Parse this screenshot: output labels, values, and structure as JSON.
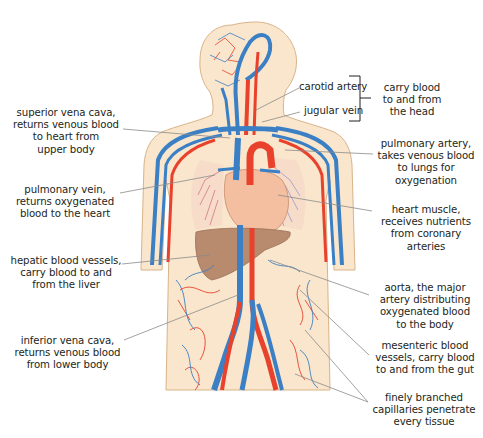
{
  "colors": {
    "skin": "#f9e6cc",
    "skin_outline": "#d9b48a",
    "artery": "#e8412c",
    "vein": "#3b7fc4",
    "heart": "#f4bfa0",
    "liver": "#b88a6e",
    "leader_line": "#8a8a8a",
    "text": "#231f20"
  },
  "labels": {
    "superior_vena_cava": "superior vena cava,\nreturns venous blood\nto heart from\nupper body",
    "pulmonary_vein": "pulmonary vein,\nreturns oxygenated\nblood to the heart",
    "hepatic_vessels": "hepatic blood vessels,\ncarry blood to and\nfrom the liver",
    "inferior_vena_cava": "inferior vena cava,\nreturns venous blood\nfrom lower body",
    "carotid_artery": "carotid artery",
    "jugular_vein": "jugular vein",
    "head_group": "carry blood\nto and from\nthe head",
    "pulmonary_artery": "pulmonary artery,\ntakes venous blood\nto lungs for\noxygenation",
    "heart_muscle": "heart muscle,\nreceives nutrients\nfrom coronary\narteries",
    "aorta": "aorta, the major\nartery distributing\noxygenated blood\nto the body",
    "mesenteric_vessels": "mesenteric blood\nvessels, carry blood\nto and from the gut",
    "capillaries": "finely branched\ncapillaries penetrate\nevery tissue"
  }
}
